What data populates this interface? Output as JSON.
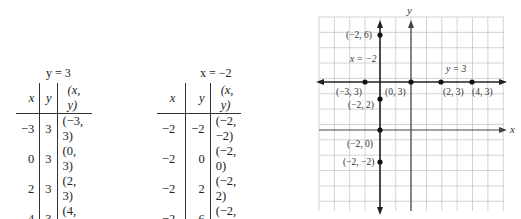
{
  "table_y3": {
    "title": "y = 3",
    "headers": [
      "x",
      "y",
      "(x, y)"
    ],
    "rows": [
      [
        "−3",
        "3",
        "(−3, 3)"
      ],
      [
        "0",
        "3",
        "(0, 3)"
      ],
      [
        "2",
        "3",
        "(2, 3)"
      ],
      [
        "4",
        "3",
        "(4, 3)"
      ]
    ]
  },
  "table_xm2": {
    "title": "x = −2",
    "headers": [
      "x",
      "y",
      "(x, y)"
    ],
    "rows": [
      [
        "−2",
        "−2",
        "(−2, −2)"
      ],
      [
        "−2",
        "0",
        "(−2, 0)"
      ],
      [
        "−2",
        "2",
        "(−2, 2)"
      ],
      [
        "−2",
        "6",
        "(−2, 6)"
      ]
    ]
  },
  "graph": {
    "x_axis_label": "x",
    "y_axis_label": "y",
    "line_labels": {
      "horizontal": "y = 3",
      "vertical": "x = −2"
    },
    "points": [
      {
        "label": "(−3, 3)",
        "x": -3,
        "y": 3
      },
      {
        "label": "(0, 3)",
        "x": 0,
        "y": 3
      },
      {
        "label": "(2, 3)",
        "x": 2,
        "y": 3
      },
      {
        "label": "(4, 3)",
        "x": 4,
        "y": 3
      },
      {
        "label": "(−2, 6)",
        "x": -2,
        "y": 6
      },
      {
        "label": "(−2, 2)",
        "x": -2,
        "y": 2
      },
      {
        "label": "(−2, 0)",
        "x": -2,
        "y": 0
      },
      {
        "label": "(−2, −2)",
        "x": -2,
        "y": -2
      }
    ]
  }
}
